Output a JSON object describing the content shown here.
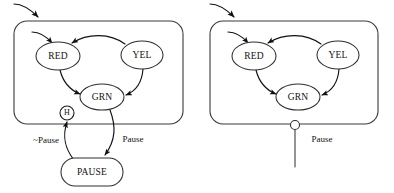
{
  "diagram": {
    "type": "uml-statechart",
    "panels": [
      {
        "id": "left",
        "name": "statechart-with-history",
        "region_label": "",
        "states": [
          {
            "id": "red",
            "label": "RED",
            "shape": "ellipse",
            "cx": 58,
            "cy": 56,
            "rx": 22,
            "ry": 14
          },
          {
            "id": "yel",
            "label": "YEL",
            "shape": "ellipse",
            "cx": 142,
            "cy": 55,
            "rx": 21,
            "ry": 14
          },
          {
            "id": "grn",
            "label": "GRN",
            "shape": "ellipse",
            "cx": 102,
            "cy": 97,
            "rx": 22,
            "ry": 13
          },
          {
            "id": "pause",
            "label": "PAUSE",
            "shape": "rounded-rect",
            "cx": 92,
            "cy": 172,
            "rx": 31,
            "ry": 14
          }
        ],
        "pseudostates": [
          {
            "id": "history",
            "label": "H",
            "shape": "circle",
            "cx": 67,
            "cy": 113,
            "r": 7
          }
        ],
        "transitions": [
          {
            "id": "initial-region",
            "label": "",
            "from": "start",
            "to": "region"
          },
          {
            "id": "initial-red",
            "label": "",
            "from": "start",
            "to": "red"
          },
          {
            "id": "yel-red",
            "label": "",
            "from": "yel",
            "to": "red"
          },
          {
            "id": "red-grn",
            "label": "",
            "from": "red",
            "to": "grn"
          },
          {
            "id": "yel-grn",
            "label": "",
            "from": "yel",
            "to": "grn"
          },
          {
            "id": "region-pause",
            "label": "Pause",
            "from": "region",
            "to": "pause"
          },
          {
            "id": "pause-history",
            "label": "~Pause",
            "from": "pause",
            "to": "history"
          }
        ]
      },
      {
        "id": "right",
        "name": "statechart-with-pause-port",
        "region_label": "",
        "states": [
          {
            "id": "red",
            "label": "RED",
            "shape": "ellipse",
            "cx": 254,
            "cy": 56,
            "rx": 22,
            "ry": 14
          },
          {
            "id": "yel",
            "label": "YEL",
            "shape": "ellipse",
            "cx": 338,
            "cy": 55,
            "rx": 21,
            "ry": 14
          },
          {
            "id": "grn",
            "label": "GRN",
            "shape": "ellipse",
            "cx": 298,
            "cy": 97,
            "rx": 22,
            "ry": 13
          }
        ],
        "pseudostates": [
          {
            "id": "pause-port",
            "label": "",
            "shape": "circle",
            "cx": 295,
            "cy": 125,
            "r": 4.5
          }
        ],
        "transitions": [
          {
            "id": "initial-region",
            "label": "",
            "from": "start",
            "to": "region"
          },
          {
            "id": "initial-red",
            "label": "",
            "from": "start",
            "to": "red"
          },
          {
            "id": "yel-red",
            "label": "",
            "from": "yel",
            "to": "red"
          },
          {
            "id": "red-grn",
            "label": "",
            "from": "red",
            "to": "grn"
          },
          {
            "id": "yel-grn",
            "label": "",
            "from": "yel",
            "to": "grn"
          },
          {
            "id": "port-pause",
            "label": "Pause",
            "from": "pause-port",
            "to": "external"
          }
        ]
      }
    ],
    "colors": {
      "stroke": "#111111",
      "region_stroke": "#3a3a3a",
      "node_fill": "#ffffff",
      "background": "#ffffff",
      "text": "#111111"
    }
  }
}
